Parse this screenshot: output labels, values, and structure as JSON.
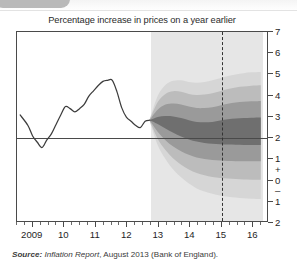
{
  "figure": {
    "title": "Percentage increase in prices on a year earlier",
    "source_prefix": "Source:",
    "source_publication": "Inflation Report",
    "source_rest": ", August 2013 (Bank of England)."
  },
  "chart_data": {
    "type": "area",
    "title": "Percentage increase in prices on a year earlier",
    "subtitle": "",
    "xlabel": "",
    "ylabel": "",
    "xlim": [
      2008.5,
      2016.5
    ],
    "ylim": [
      -2,
      7
    ],
    "grid": false,
    "legend_position": "none",
    "y_ticks": [
      7,
      6,
      5,
      4,
      3,
      2,
      1,
      0,
      -1,
      -2
    ],
    "y_tick_labels": [
      "7",
      "6",
      "5",
      "4",
      "3",
      "2",
      "1",
      "0",
      "1",
      "2"
    ],
    "y_sign_plus": "+",
    "y_sign_minus": "–",
    "x_ticks": [
      2009,
      2010,
      2011,
      2012,
      2013,
      2014,
      2015,
      2016
    ],
    "x_tick_labels": [
      "2009",
      "10",
      "11",
      "12",
      "13",
      "14",
      "15",
      "16"
    ],
    "x_minor_interval": 0.25,
    "target_line": {
      "label": "Inflation target",
      "value": 2
    },
    "forecast_start": 2012.75,
    "forecast_marker": {
      "label": "Two-year forecast horizon",
      "value": 2015.0
    },
    "history_series": {
      "name": "CPI inflation",
      "x": [
        2008.6,
        2008.85,
        2009.0,
        2009.15,
        2009.3,
        2009.45,
        2009.6,
        2009.75,
        2009.9,
        2010.05,
        2010.2,
        2010.35,
        2010.5,
        2010.65,
        2010.8,
        2010.95,
        2011.1,
        2011.25,
        2011.4,
        2011.55,
        2011.7,
        2011.85,
        2012.0,
        2012.15,
        2012.3,
        2012.45,
        2012.6,
        2012.75
      ],
      "y": [
        3.05,
        2.55,
        2.05,
        1.75,
        1.5,
        1.85,
        2.15,
        2.6,
        3.05,
        3.45,
        3.35,
        3.2,
        3.35,
        3.55,
        3.95,
        4.2,
        4.45,
        4.65,
        4.7,
        4.7,
        4.15,
        3.4,
        2.95,
        2.75,
        2.55,
        2.45,
        2.75,
        2.8
      ]
    },
    "fan_bands": [
      {
        "name": "central 30% band",
        "color": "#6f6f6f",
        "x": [
          2012.75,
          2013.0,
          2013.25,
          2013.5,
          2013.75,
          2014.0,
          2014.25,
          2014.5,
          2014.75,
          2015.0,
          2015.25,
          2015.5,
          2015.75,
          2016.0,
          2016.3
        ],
        "upper": [
          2.8,
          2.95,
          3.0,
          2.98,
          2.9,
          2.8,
          2.72,
          2.7,
          2.72,
          2.78,
          2.84,
          2.88,
          2.9,
          2.92,
          2.93
        ],
        "lower": [
          2.8,
          2.62,
          2.4,
          2.2,
          2.02,
          1.88,
          1.78,
          1.72,
          1.68,
          1.66,
          1.64,
          1.63,
          1.62,
          1.62,
          1.62
        ]
      },
      {
        "name": "50% band",
        "color": "#9a9a9a",
        "x": [
          2012.75,
          2013.0,
          2013.25,
          2013.5,
          2013.75,
          2014.0,
          2014.25,
          2014.5,
          2014.75,
          2015.0,
          2015.25,
          2015.5,
          2015.75,
          2016.0,
          2016.3
        ],
        "upper": [
          2.82,
          3.3,
          3.55,
          3.6,
          3.55,
          3.45,
          3.38,
          3.38,
          3.42,
          3.5,
          3.58,
          3.64,
          3.68,
          3.7,
          3.72
        ],
        "lower": [
          2.78,
          2.25,
          1.85,
          1.55,
          1.32,
          1.15,
          1.02,
          0.95,
          0.9,
          0.88,
          0.86,
          0.85,
          0.84,
          0.84,
          0.84
        ]
      },
      {
        "name": "70% band",
        "color": "#bcbcbc",
        "x": [
          2012.75,
          2013.0,
          2013.25,
          2013.5,
          2013.75,
          2014.0,
          2014.25,
          2014.5,
          2014.75,
          2015.0,
          2015.25,
          2015.5,
          2015.75,
          2016.0,
          2016.3
        ],
        "upper": [
          2.84,
          3.65,
          4.05,
          4.18,
          4.15,
          4.05,
          4.0,
          4.02,
          4.08,
          4.18,
          4.28,
          4.36,
          4.4,
          4.44,
          4.46
        ],
        "lower": [
          2.76,
          1.92,
          1.38,
          0.98,
          0.68,
          0.45,
          0.28,
          0.18,
          0.1,
          0.05,
          0.02,
          0.0,
          -0.02,
          -0.03,
          -0.04
        ]
      },
      {
        "name": "90% band",
        "color": "#d6d6d6",
        "x": [
          2012.75,
          2013.0,
          2013.25,
          2013.5,
          2013.75,
          2014.0,
          2014.25,
          2014.5,
          2014.75,
          2015.0,
          2015.25,
          2015.5,
          2015.75,
          2016.0,
          2016.3
        ],
        "upper": [
          2.86,
          3.95,
          4.48,
          4.68,
          4.7,
          4.62,
          4.58,
          4.62,
          4.7,
          4.8,
          4.9,
          4.98,
          5.04,
          5.08,
          5.1
        ],
        "lower": [
          2.74,
          1.62,
          0.95,
          0.45,
          0.08,
          -0.22,
          -0.45,
          -0.6,
          -0.7,
          -0.78,
          -0.84,
          -0.88,
          -0.92,
          -0.94,
          -0.95
        ]
      }
    ]
  }
}
